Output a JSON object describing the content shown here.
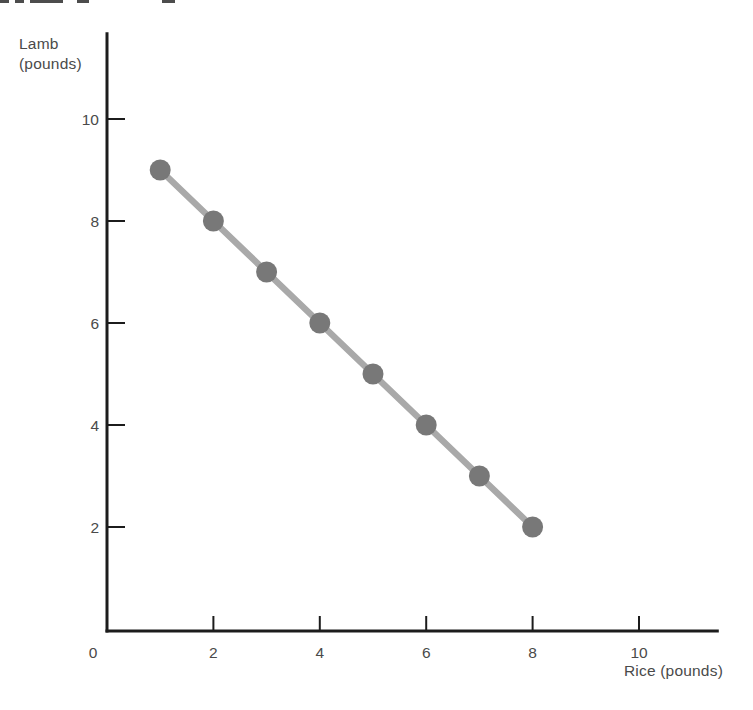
{
  "figure": {
    "y_axis_title_line1": "Lamb",
    "y_axis_title_line2": "(pounds)",
    "x_axis_title": "Rice (pounds)",
    "origin_label": "0"
  },
  "chart_data": {
    "type": "line",
    "title": "",
    "xlabel": "Rice (pounds)",
    "ylabel": "Lamb (pounds)",
    "x": [
      1,
      2,
      3,
      4,
      5,
      6,
      7,
      8
    ],
    "y": [
      9,
      8,
      7,
      6,
      5,
      4,
      3,
      2
    ],
    "x_ticks": [
      2,
      4,
      6,
      8,
      10
    ],
    "y_ticks": [
      2,
      4,
      6,
      8,
      10
    ],
    "xlim": [
      0,
      11.5
    ],
    "ylim": [
      0,
      11.7
    ],
    "grid": false,
    "legend": null,
    "line_color": "#a9a9a9",
    "marker_color": "#787878",
    "axis_color": "#1c1c1c",
    "label_color": "#4a4a4a"
  }
}
